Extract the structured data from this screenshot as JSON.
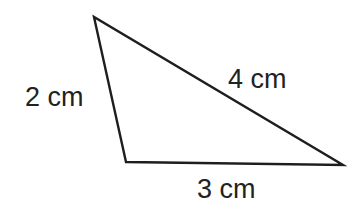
{
  "figure": {
    "type": "triangle",
    "vertices": {
      "top": [
        94,
        17
      ],
      "bottom_left": [
        126,
        162
      ],
      "right": [
        343,
        165
      ]
    },
    "stroke_color": "#1e1e1e",
    "fill_color": "#ffffff",
    "background": "#ffffff"
  },
  "labels": {
    "left_side": "2 cm",
    "hypotenuse": "4 cm",
    "bottom_side": "3 cm"
  }
}
